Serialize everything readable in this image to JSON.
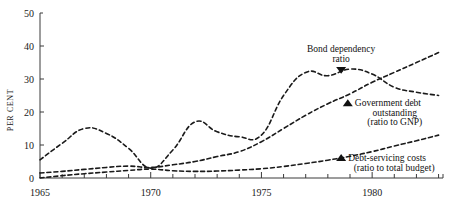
{
  "chart_data": {
    "type": "line",
    "title": "",
    "xlabel": "",
    "ylabel": "PER CENT",
    "xlim": [
      1965,
      1983.2
    ],
    "ylim": [
      0,
      50
    ],
    "grid": false,
    "legend_position": "inline-annotations",
    "x_tick_labels": [
      "1965",
      "1970",
      "1975",
      "1980"
    ],
    "x_tick_values": [
      1965,
      1970,
      1975,
      1980
    ],
    "x_minor_ticks": [
      1966,
      1967,
      1968,
      1969,
      1971,
      1972,
      1973,
      1974,
      1976,
      1977,
      1978,
      1979,
      1981,
      1982,
      1983
    ],
    "y_tick_labels": [
      "0",
      "10",
      "20",
      "30",
      "40",
      "50"
    ],
    "y_tick_values": [
      0,
      10,
      20,
      30,
      40,
      50
    ],
    "line_style": "dashed",
    "line_color": "#111111",
    "x": [
      1965,
      1966,
      1967,
      1968,
      1969,
      1970,
      1971,
      1972,
      1973,
      1974,
      1975,
      1976,
      1977,
      1978,
      1979,
      1980,
      1981,
      1982,
      1983
    ],
    "series": [
      {
        "name": "Bond dependency ratio",
        "marker": "triangle-down",
        "values": [
          5.5,
          10.5,
          15.0,
          13.5,
          9.0,
          3.0,
          8.5,
          17.0,
          14.0,
          12.5,
          13.0,
          25.0,
          32.0,
          31.0,
          33.0,
          31.5,
          27.5,
          26.0,
          25.0
        ]
      },
      {
        "name": "Government debt outstanding",
        "sub": "(ratio to GNP)",
        "marker": "triangle-up",
        "values": [
          1.5,
          2.0,
          2.6,
          3.2,
          3.6,
          3.2,
          4.0,
          5.0,
          6.5,
          8.0,
          11.0,
          15.0,
          19.0,
          22.5,
          25.5,
          29.0,
          32.0,
          35.0,
          38.0
        ]
      },
      {
        "name": "Debt-servicing costs",
        "sub": "(ratio to total budget)",
        "marker": "triangle-up",
        "values": [
          0.0,
          0.7,
          1.3,
          1.8,
          2.3,
          2.7,
          2.2,
          2.0,
          2.1,
          2.4,
          2.8,
          3.5,
          4.4,
          5.4,
          6.6,
          8.0,
          9.7,
          11.3,
          13.0
        ]
      }
    ],
    "annotations": [
      {
        "id": "bond-dependency",
        "line1": "Bond dependency",
        "line2": "ratio",
        "marker": "▼",
        "marker_x": 1978.6,
        "marker_y": 32.6
      },
      {
        "id": "government-debt",
        "line1": "Government debt",
        "line2": "outstanding",
        "line3": "(ratio to GNP)",
        "marker": "▲",
        "marker_x": 1978.9,
        "marker_y": 22.8
      },
      {
        "id": "debt-servicing",
        "line1": "Debt-servicing costs",
        "line2": "(ratio to total budget)",
        "marker": "▲",
        "marker_x": 1978.6,
        "marker_y": 6.2
      }
    ]
  }
}
